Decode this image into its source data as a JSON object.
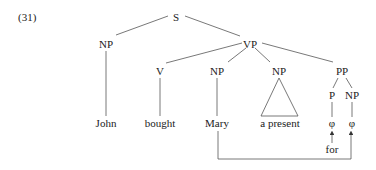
{
  "example_number": "(31)",
  "tree": {
    "root": "S",
    "subject_np": "NP",
    "vp": "VP",
    "v": "V",
    "object_np": "NP",
    "second_np": "NP",
    "pp": "PP",
    "p": "P",
    "pp_np": "NP"
  },
  "leaves": {
    "john": "John",
    "bought": "bought",
    "mary": "Mary",
    "a_present": "a present",
    "p_empty": "φ",
    "np_empty": "φ",
    "for": "for"
  },
  "colors": {
    "text": "#222222",
    "line": "#555555"
  }
}
